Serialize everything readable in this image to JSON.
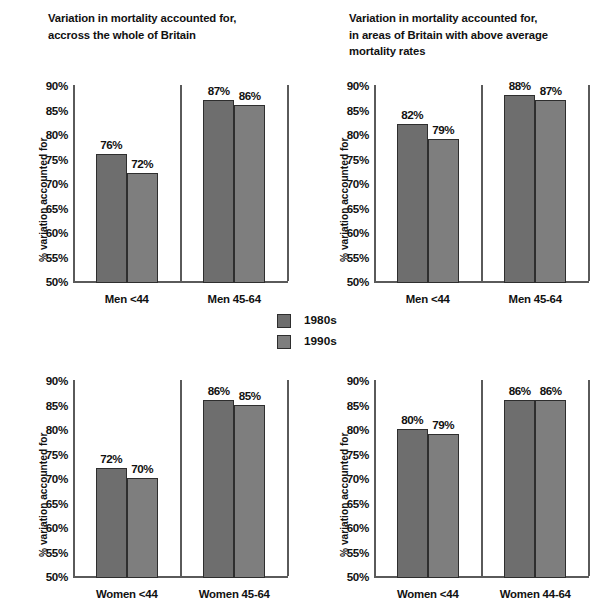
{
  "legend": {
    "entries": [
      {
        "label": "1980s",
        "color": "#6e6e6e"
      },
      {
        "label": "1990s",
        "color": "#7e7e7e"
      }
    ]
  },
  "axis": {
    "ylabel": "% variation accounted for",
    "ticks": [
      "90%",
      "85%",
      "80%",
      "75%",
      "70%",
      "65%",
      "60%",
      "55%",
      "50%"
    ]
  },
  "charts": [
    {
      "id": "top-left",
      "title": "Variation in mortality accounted for,\naccross the whole of Britain",
      "categories": [
        "Men <44",
        "Men 45-64"
      ],
      "series": [
        {
          "name": "1980s",
          "values": [
            76,
            87
          ],
          "labels": [
            "76%",
            "87%"
          ]
        },
        {
          "name": "1990s",
          "values": [
            72,
            86
          ],
          "labels": [
            "72%",
            "86%"
          ]
        }
      ]
    },
    {
      "id": "top-right",
      "title": "Variation in mortality accounted for,\nin areas of Britain with above average\nmortality rates",
      "categories": [
        "Men <44",
        "Men 45-64"
      ],
      "series": [
        {
          "name": "1980s",
          "values": [
            82,
            88
          ],
          "labels": [
            "82%",
            "88%"
          ]
        },
        {
          "name": "1990s",
          "values": [
            79,
            87
          ],
          "labels": [
            "79%",
            "87%"
          ]
        }
      ]
    },
    {
      "id": "bottom-left",
      "title": "",
      "categories": [
        "Women <44",
        "Women 45-64"
      ],
      "series": [
        {
          "name": "1980s",
          "values": [
            72,
            86
          ],
          "labels": [
            "72%",
            "86%"
          ]
        },
        {
          "name": "1990s",
          "values": [
            70,
            85
          ],
          "labels": [
            "70%",
            "85%"
          ]
        }
      ]
    },
    {
      "id": "bottom-right",
      "title": "",
      "categories": [
        "Women <44",
        "Women 44-64"
      ],
      "series": [
        {
          "name": "1980s",
          "values": [
            80,
            86
          ],
          "labels": [
            "80%",
            "86%"
          ]
        },
        {
          "name": "1990s",
          "values": [
            79,
            86
          ],
          "labels": [
            "79%",
            "86%"
          ]
        }
      ]
    }
  ],
  "chart_data": {
    "type": "bar",
    "ylabel": "% variation accounted for",
    "xlabel": "",
    "ylim": [
      50,
      90
    ],
    "ytick_step": 5,
    "yticks": [
      50,
      55,
      60,
      65,
      70,
      75,
      80,
      85,
      90
    ],
    "ytick_labels": [
      "50%",
      "55%",
      "60%",
      "65%",
      "70%",
      "75%",
      "80%",
      "85%",
      "90%"
    ],
    "grid": false,
    "legend": [
      "1980s",
      "1990s"
    ],
    "legend_position": "center",
    "panels": [
      {
        "panel": "top-left",
        "title": "Variation in mortality accounted for, accross the whole of Britain",
        "categories": [
          "Men <44",
          "Men 45-64"
        ],
        "series": [
          {
            "name": "1980s",
            "values": [
              76,
              87
            ]
          },
          {
            "name": "1990s",
            "values": [
              72,
              86
            ]
          }
        ]
      },
      {
        "panel": "top-right",
        "title": "Variation in mortality accounted for, in areas of Britain with above average mortality rates",
        "categories": [
          "Men <44",
          "Men 45-64"
        ],
        "series": [
          {
            "name": "1980s",
            "values": [
              82,
              88
            ]
          },
          {
            "name": "1990s",
            "values": [
              79,
              87
            ]
          }
        ]
      },
      {
        "panel": "bottom-left",
        "title": "Variation in mortality accounted for, accross the whole of Britain",
        "categories": [
          "Women <44",
          "Women 45-64"
        ],
        "series": [
          {
            "name": "1980s",
            "values": [
              72,
              86
            ]
          },
          {
            "name": "1990s",
            "values": [
              70,
              85
            ]
          }
        ]
      },
      {
        "panel": "bottom-right",
        "title": "Variation in mortality accounted for, in areas of Britain with above average mortality rates",
        "categories": [
          "Women <44",
          "Women 44-64"
        ],
        "series": [
          {
            "name": "1980s",
            "values": [
              80,
              86
            ]
          },
          {
            "name": "1990s",
            "values": [
              79,
              86
            ]
          }
        ]
      }
    ]
  }
}
